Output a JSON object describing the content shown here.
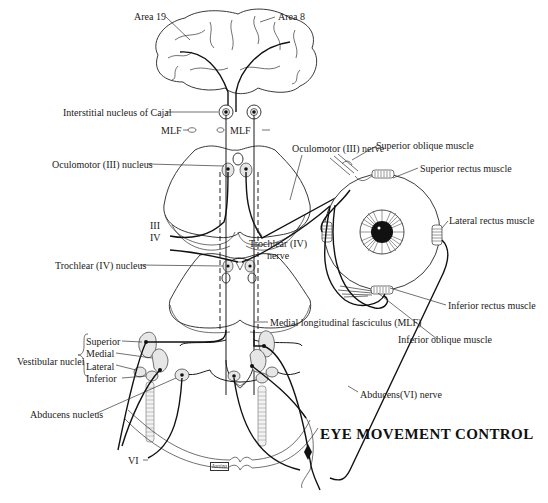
{
  "title": "EYE MOVEMENT CONTROL",
  "signature": "Ianiza",
  "cortex": {
    "area_19": "Area 19",
    "area_8": "Area 8"
  },
  "brainstem_labels": {
    "interstitial_nucleus": "Interstitial nucleus of Cajal",
    "mlf_left": "MLF",
    "mlf_right": "MLF",
    "oculomotor_nucleus": "Oculomotor (III) nucleus",
    "nerve_iii": "III",
    "nerve_iv": "IV",
    "trochlear_nucleus": "Trochlear (IV) nucleus",
    "mlf_full": "Medial longitudinal fasciculus (MLF)"
  },
  "nerves": {
    "oculomotor_nerve": "Oculomotor (III) nerve",
    "trochlear_nerve_line1": "Trochlear (IV)",
    "trochlear_nerve_line2": "nerve",
    "abducens_nerve": "Abducens(VI) nerve",
    "vi": "VI"
  },
  "muscles": {
    "superior_oblique": "Superior oblique muscle",
    "superior_rectus": "Superior rectus muscle",
    "lateral_rectus": "Lateral rectus muscle",
    "inferior_rectus": "Inferior rectus muscle",
    "inferior_oblique": "Inferior oblique muscle"
  },
  "vestibular": {
    "group_label": "Vestibular nuclei",
    "items": [
      "Superior",
      "Medial",
      "Lateral",
      "Inferior"
    ]
  },
  "abducens_nucleus": "Abducens nucleus"
}
